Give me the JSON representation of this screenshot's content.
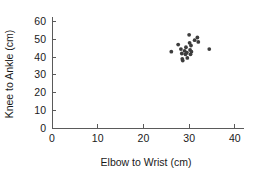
{
  "chart_data": {
    "type": "scatter",
    "title": "",
    "xlabel": "Elbow to Wrist (cm)",
    "ylabel": "Knee to Ankle (cm)",
    "xlim": [
      0,
      42
    ],
    "ylim": [
      0,
      62
    ],
    "xticks": [
      0,
      10,
      20,
      30,
      40
    ],
    "yticks": [
      0,
      10,
      20,
      30,
      40,
      50,
      60
    ],
    "xtick_labels": [
      "0",
      "10",
      "20",
      "30",
      "40"
    ],
    "ytick_labels": [
      "0",
      "10",
      "20",
      "30",
      "40",
      "50",
      "60"
    ],
    "grid": false,
    "legend": null,
    "marker_color": "#3d3d3d",
    "axis_color": "#5a5a5a",
    "series": [
      {
        "name": "measurements",
        "points": [
          {
            "x": 26.1,
            "y": 43.0
          },
          {
            "x": 27.6,
            "y": 47.0
          },
          {
            "x": 28.2,
            "y": 44.5
          },
          {
            "x": 28.4,
            "y": 42.0
          },
          {
            "x": 28.5,
            "y": 39.0
          },
          {
            "x": 28.6,
            "y": 38.0
          },
          {
            "x": 29.0,
            "y": 43.5
          },
          {
            "x": 29.2,
            "y": 41.5
          },
          {
            "x": 29.3,
            "y": 45.5
          },
          {
            "x": 29.5,
            "y": 42.5
          },
          {
            "x": 29.6,
            "y": 39.5
          },
          {
            "x": 30.0,
            "y": 52.5
          },
          {
            "x": 30.1,
            "y": 48.0
          },
          {
            "x": 30.2,
            "y": 44.0
          },
          {
            "x": 30.3,
            "y": 41.5
          },
          {
            "x": 30.4,
            "y": 46.5
          },
          {
            "x": 30.5,
            "y": 43.0
          },
          {
            "x": 31.2,
            "y": 49.5
          },
          {
            "x": 31.8,
            "y": 51.0
          },
          {
            "x": 32.0,
            "y": 48.5
          },
          {
            "x": 34.4,
            "y": 44.5
          }
        ]
      }
    ]
  }
}
